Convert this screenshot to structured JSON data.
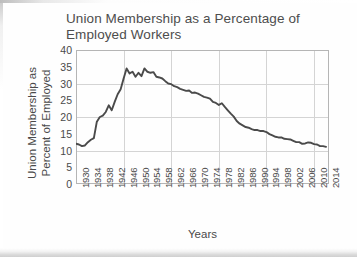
{
  "chart_data": {
    "type": "line",
    "title": "Union Membership as a Percentage of Employed Workers",
    "title_line1": "Union Membership as a Percentage of",
    "title_line2": "Employed Workers",
    "xlabel": "Years",
    "ylabel": "Union Membership as Percent of Employed",
    "ylabel_line1": "Union Membership as",
    "ylabel_line2": "Percent of Employed",
    "ylim": [
      0,
      40
    ],
    "xlim": [
      1930,
      2015
    ],
    "ytick_labels": [
      "40",
      "35",
      "30",
      "25",
      "20",
      "15",
      "10",
      "5",
      "0"
    ],
    "ytick_values": [
      40,
      35,
      30,
      25,
      20,
      15,
      10,
      5,
      0
    ],
    "xtick_labels": [
      "1930",
      "1934",
      "1938",
      "1942",
      "1946",
      "1950",
      "1954",
      "1958",
      "1962",
      "1966",
      "1970",
      "1974",
      "1978",
      "1982",
      "1986",
      "1990",
      "1994",
      "1998",
      "2002",
      "2006",
      "2010",
      "2014"
    ],
    "grid": {
      "horizontal_at": [
        30,
        20,
        10
      ],
      "vertical_at": [
        1946,
        1962,
        1978,
        1994,
        2010
      ],
      "color": "#d4d4d4"
    },
    "legend": null,
    "line_color": "#4a4a4a",
    "series": [
      {
        "name": "Union membership (% of employed)",
        "x": [
          1930,
          1931,
          1932,
          1933,
          1934,
          1935,
          1936,
          1937,
          1938,
          1939,
          1940,
          1941,
          1942,
          1943,
          1944,
          1945,
          1946,
          1947,
          1948,
          1949,
          1950,
          1951,
          1952,
          1953,
          1954,
          1955,
          1956,
          1957,
          1958,
          1959,
          1960,
          1961,
          1962,
          1963,
          1964,
          1965,
          1966,
          1967,
          1968,
          1969,
          1970,
          1971,
          1972,
          1973,
          1974,
          1975,
          1976,
          1977,
          1978,
          1979,
          1980,
          1981,
          1982,
          1983,
          1984,
          1985,
          1986,
          1987,
          1988,
          1989,
          1990,
          1991,
          1992,
          1993,
          1994,
          1995,
          1996,
          1997,
          1998,
          1999,
          2000,
          2001,
          2002,
          2003,
          2004,
          2005,
          2006,
          2007,
          2008,
          2009,
          2010,
          2011,
          2012,
          2013,
          2014
        ],
        "values": [
          12.0,
          11.8,
          11.3,
          11.5,
          12.5,
          13.2,
          13.7,
          18.6,
          20.0,
          20.4,
          21.5,
          23.5,
          22.0,
          24.5,
          26.8,
          28.3,
          31.5,
          34.5,
          33.0,
          33.5,
          32.0,
          33.2,
          32.2,
          34.5,
          33.5,
          33.2,
          33.4,
          32.0,
          31.8,
          31.5,
          30.7,
          30.0,
          29.8,
          29.2,
          28.9,
          28.4,
          28.1,
          27.8,
          27.9,
          27.2,
          27.3,
          27.0,
          26.5,
          26.0,
          25.8,
          25.5,
          24.5,
          24.2,
          23.6,
          24.1,
          23.0,
          22.0,
          21.0,
          20.1,
          18.8,
          18.0,
          17.5,
          17.0,
          16.8,
          16.4,
          16.1,
          16.1,
          15.8,
          15.8,
          15.5,
          14.9,
          14.5,
          14.1,
          13.9,
          13.9,
          13.5,
          13.4,
          13.3,
          12.9,
          12.5,
          12.5,
          12.0,
          12.1,
          12.4,
          12.3,
          11.9,
          11.8,
          11.3,
          11.3,
          11.1
        ]
      }
    ]
  }
}
